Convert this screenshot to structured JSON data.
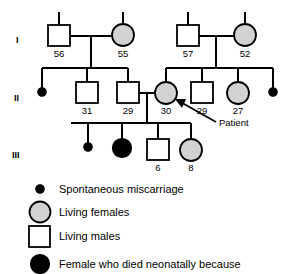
{
  "figure": {
    "colors": {
      "stroke": "#000000",
      "female_fill": "#d2d2d2",
      "male_fill": "#ffffff",
      "affected_fill": "#000000",
      "background": "#ffffff"
    }
  },
  "generations": [
    {
      "label": "I"
    },
    {
      "label": "II"
    },
    {
      "label": "III"
    }
  ],
  "individuals": [
    {
      "id": "I-1",
      "shape": "square",
      "fill": "open",
      "age": "56",
      "generation": "I"
    },
    {
      "id": "I-2",
      "shape": "circle",
      "fill": "gray",
      "age": "55",
      "generation": "I"
    },
    {
      "id": "I-3",
      "shape": "square",
      "fill": "open",
      "age": "57",
      "generation": "I"
    },
    {
      "id": "I-4",
      "shape": "circle",
      "fill": "gray",
      "age": "52",
      "generation": "I"
    },
    {
      "id": "II-1",
      "shape": "dot",
      "fill": "filled",
      "age": "",
      "generation": "II"
    },
    {
      "id": "II-2",
      "shape": "square",
      "fill": "open",
      "age": "31",
      "generation": "II"
    },
    {
      "id": "II-3",
      "shape": "square",
      "fill": "open",
      "age": "29",
      "generation": "II"
    },
    {
      "id": "II-4",
      "shape": "circle",
      "fill": "gray",
      "age": "30",
      "generation": "II"
    },
    {
      "id": "II-5",
      "shape": "square",
      "fill": "open",
      "age": "29",
      "generation": "II"
    },
    {
      "id": "II-6",
      "shape": "circle",
      "fill": "gray",
      "age": "27",
      "generation": "II"
    },
    {
      "id": "II-7",
      "shape": "dot",
      "fill": "filled",
      "age": "",
      "generation": "II"
    },
    {
      "id": "III-1",
      "shape": "dot",
      "fill": "filled",
      "age": "",
      "generation": "III"
    },
    {
      "id": "III-2",
      "shape": "circle",
      "fill": "filled",
      "age": "",
      "generation": "III"
    },
    {
      "id": "III-3",
      "shape": "square",
      "fill": "open",
      "age": "6",
      "generation": "III"
    },
    {
      "id": "III-4",
      "shape": "circle",
      "fill": "gray",
      "age": "8",
      "generation": "III"
    }
  ],
  "annotations": {
    "patient_label": "Patient"
  },
  "legend": {
    "items": [
      {
        "symbol": "dot",
        "label": "Spontaneous miscarriage"
      },
      {
        "symbol": "circle-gray",
        "label": "Living females"
      },
      {
        "symbol": "square-open",
        "label": "Living males"
      },
      {
        "symbol": "circle-filled",
        "label": "Female who died neonatally because"
      }
    ]
  }
}
